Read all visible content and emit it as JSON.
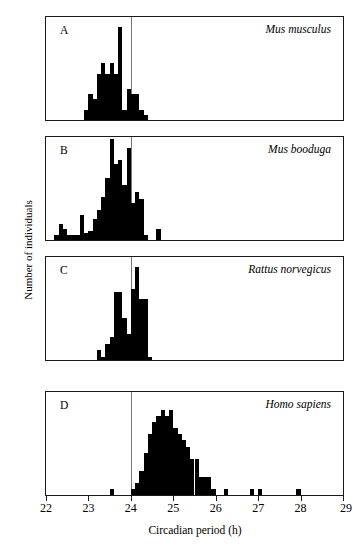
{
  "figure": {
    "xlabel": "Circadian period (h)",
    "ylabel": "Number of individuals",
    "xticks": [
      22,
      23,
      24,
      25,
      26,
      27,
      28,
      29
    ],
    "xlim": [
      22,
      29
    ],
    "reference_line_x": 24,
    "reference_line_color": "#77777c",
    "bar_color": "#000000",
    "axis_color": "#1a1a1a"
  },
  "panels": [
    {
      "letter": "A",
      "species": "Mus musculus",
      "ylim": [
        0,
        20
      ],
      "yticks": [
        0,
        5,
        10,
        15,
        20
      ]
    },
    {
      "letter": "B",
      "species": "Mus booduga",
      "ylim": [
        0,
        45
      ],
      "yticks": [
        0,
        10,
        20,
        30,
        40
      ]
    },
    {
      "letter": "C",
      "species": "Rattus norvegicus",
      "ylim": [
        0,
        32
      ],
      "yticks": [
        0,
        10,
        20,
        30
      ]
    },
    {
      "letter": "D",
      "species": "Homo sapiens",
      "ylim": [
        0,
        17
      ],
      "yticks": [
        0,
        5,
        10,
        15
      ]
    }
  ],
  "chart_data": [
    {
      "type": "bar",
      "panel": "A",
      "title": "Mus musculus",
      "xlabel": "Circadian period (h)",
      "ylabel": "Number of individuals",
      "xlim": [
        22,
        29
      ],
      "ylim": [
        0,
        20
      ],
      "bin_width": 0.1,
      "grid": false,
      "legend": "none",
      "annotations": [
        "A",
        "Mus musculus"
      ],
      "reference_line_x": 24,
      "bin_left_edges": [
        22.9,
        23.0,
        23.1,
        23.2,
        23.3,
        23.4,
        23.5,
        23.6,
        23.7,
        23.8,
        23.9,
        24.0,
        24.1,
        24.2,
        24.3
      ],
      "values": [
        2,
        5,
        4,
        9,
        11,
        9,
        11,
        9,
        18,
        2,
        6,
        5,
        5,
        2,
        1
      ]
    },
    {
      "type": "bar",
      "panel": "B",
      "title": "Mus booduga",
      "xlabel": "Circadian period (h)",
      "ylabel": "Number of individuals",
      "xlim": [
        22,
        29
      ],
      "ylim": [
        0,
        45
      ],
      "bin_width": 0.1,
      "grid": false,
      "legend": "none",
      "annotations": [
        "B",
        "Mus booduga"
      ],
      "reference_line_x": 24,
      "bin_left_edges": [
        22.2,
        22.3,
        22.4,
        22.5,
        22.6,
        22.7,
        22.8,
        22.9,
        23.0,
        23.1,
        23.2,
        23.3,
        23.4,
        23.5,
        23.6,
        23.7,
        23.8,
        23.9,
        24.0,
        24.1,
        24.2,
        24.3,
        24.6
      ],
      "values": [
        2,
        7,
        5,
        2,
        2,
        2,
        11,
        3,
        4,
        9,
        13,
        19,
        27,
        44,
        33,
        35,
        24,
        40,
        16,
        21,
        18,
        2,
        5
      ]
    },
    {
      "type": "bar",
      "panel": "C",
      "title": "Rattus norvegicus",
      "xlabel": "Circadian period (h)",
      "ylabel": "Number of individuals",
      "xlim": [
        22,
        29
      ],
      "ylim": [
        0,
        32
      ],
      "bin_width": 0.1,
      "grid": false,
      "legend": "none",
      "annotations": [
        "C",
        "Rattus norvegicus"
      ],
      "reference_line_x": 24,
      "bin_left_edges": [
        23.2,
        23.3,
        23.4,
        23.5,
        23.6,
        23.7,
        23.8,
        23.9,
        24.0,
        24.1,
        24.2,
        24.3,
        24.4
      ],
      "values": [
        3,
        1,
        5,
        7,
        21,
        21,
        13,
        8,
        22,
        29,
        19,
        19,
        1
      ]
    },
    {
      "type": "bar",
      "panel": "D",
      "title": "Homo sapiens",
      "xlabel": "Circadian period (h)",
      "ylabel": "Number of individuals",
      "xlim": [
        22,
        29
      ],
      "ylim": [
        0,
        17
      ],
      "bin_width": 0.1,
      "grid": false,
      "legend": "none",
      "annotations": [
        "D",
        "Homo sapiens"
      ],
      "reference_line_x": 24,
      "bin_left_edges": [
        23.5,
        24.0,
        24.1,
        24.2,
        24.3,
        24.4,
        24.5,
        24.6,
        24.7,
        24.8,
        24.9,
        25.0,
        25.1,
        25.2,
        25.3,
        25.4,
        25.5,
        25.6,
        25.7,
        25.8,
        25.9,
        26.2,
        26.8,
        27.0,
        27.9
      ],
      "values": [
        1,
        1,
        2,
        4,
        7,
        10,
        12,
        13,
        14,
        13,
        14,
        11,
        10,
        9,
        8,
        6,
        6,
        3,
        3,
        3,
        1,
        1,
        1,
        1,
        1
      ]
    }
  ]
}
